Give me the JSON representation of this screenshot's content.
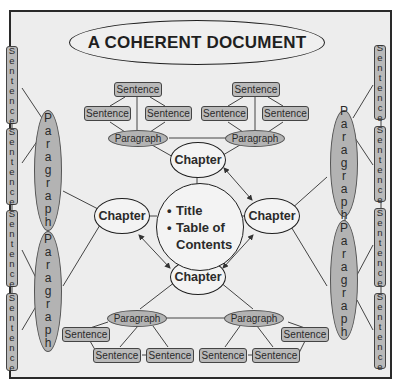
{
  "title": "A COHERENT DOCUMENT",
  "center": {
    "items": [
      "Title",
      "Table of",
      "Contents"
    ],
    "bullet": "•"
  },
  "chapters": {
    "top": "Chapter",
    "left": "Chapter",
    "right": "Chapter",
    "bottom": "Chapter"
  },
  "top_group": {
    "paragraphs": [
      "Paragraph",
      "Paragraph"
    ],
    "sentences": [
      "Sentence",
      "Sentence",
      "Sentence",
      "Sentence",
      "Sentence",
      "Sentence"
    ]
  },
  "bottom_group": {
    "paragraphs": [
      "Paragraph",
      "Paragraph"
    ],
    "sentences": [
      "Sentence",
      "Sentence",
      "Sentence",
      "Sentence",
      "Sentence",
      "Sentence"
    ]
  },
  "left_group": {
    "paragraphs": [
      "Paragraph",
      "Paragraph"
    ],
    "sentences": [
      "Sentence",
      "Sentence",
      "Sentence",
      "Sentence"
    ]
  },
  "right_group": {
    "paragraphs": [
      "Paragraph",
      "Paragraph"
    ],
    "sentences": [
      "Sentence",
      "Sentence",
      "Sentence",
      "Sentence"
    ]
  },
  "colors": {
    "background": "#ededed",
    "sentence_fill": "#b9b9b9",
    "paragraph_fill": "#b3b3b3",
    "chapter_fill": "#f3f3f3",
    "stroke": "#1f1f1f"
  }
}
